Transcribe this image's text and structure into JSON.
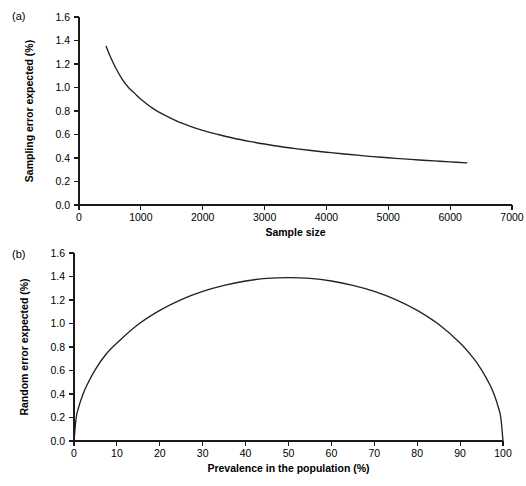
{
  "figure": {
    "panels": [
      {
        "tag": "(a)",
        "chart_data": {
          "type": "line",
          "title": "",
          "xlabel": "Sample size",
          "ylabel": "Sampling error expected (%)",
          "xlim": [
            0,
            7000
          ],
          "ylim": [
            0.0,
            1.6
          ],
          "xticks": [
            0,
            1000,
            2000,
            3000,
            4000,
            5000,
            6000,
            7000
          ],
          "xticklabels": [
            "0",
            "1000",
            "2000",
            "3000",
            "4000",
            "5000",
            "6000",
            "7000"
          ],
          "yticks": [
            0.0,
            0.2,
            0.4,
            0.6,
            0.8,
            1.0,
            1.2,
            1.4,
            1.6
          ],
          "yticklabels": [
            "0.0",
            "0.2",
            "0.4",
            "0.6",
            "0.8",
            "1.0",
            "1.2",
            "1.4",
            "1.6"
          ],
          "grid": false,
          "legend": null,
          "series": [
            {
              "name": "Sampling error vs sample size",
              "relation": "error = 28.4 / sqrt(n)",
              "x": [
                440,
                500,
                600,
                700,
                800,
                900,
                1000,
                1200,
                1400,
                1600,
                1800,
                2000,
                2250,
                2500,
                2750,
                3000,
                3250,
                3500,
                3750,
                4000,
                4250,
                4500,
                4750,
                5000,
                5250,
                5500,
                5750,
                6000,
                6270
              ],
              "y": [
                1.35,
                1.27,
                1.16,
                1.07,
                1.0,
                0.95,
                0.9,
                0.82,
                0.76,
                0.71,
                0.67,
                0.635,
                0.6,
                0.568,
                0.542,
                0.519,
                0.498,
                0.48,
                0.464,
                0.449,
                0.436,
                0.424,
                0.412,
                0.402,
                0.392,
                0.383,
                0.375,
                0.367,
                0.359
              ]
            }
          ]
        }
      },
      {
        "tag": "(b)",
        "chart_data": {
          "type": "line",
          "title": "",
          "xlabel": "Prevalence in the population (%)",
          "ylabel": "Random error expected (%)",
          "xlim": [
            0,
            100
          ],
          "ylim": [
            0.0,
            1.6
          ],
          "xticks": [
            0,
            10,
            20,
            30,
            40,
            50,
            60,
            70,
            80,
            90,
            100
          ],
          "xticklabels": [
            "0",
            "10",
            "20",
            "30",
            "40",
            "50",
            "60",
            "70",
            "80",
            "90",
            "100"
          ],
          "yticks": [
            0.0,
            0.2,
            0.4,
            0.6,
            0.8,
            1.0,
            1.2,
            1.4,
            1.6
          ],
          "yticklabels": [
            "0.0",
            "0.2",
            "0.4",
            "0.6",
            "0.8",
            "1.0",
            "1.2",
            "1.4",
            "1.6"
          ],
          "grid": false,
          "legend": null,
          "series": [
            {
              "name": "Random error vs prevalence",
              "relation": "error = 0.278 * sqrt(p*(100-p))",
              "x": [
                0,
                0.5,
                1,
                2,
                3,
                5,
                7.5,
                10,
                15,
                20,
                25,
                30,
                35,
                40,
                45,
                50,
                55,
                60,
                65,
                70,
                75,
                80,
                85,
                90,
                93,
                95,
                97,
                98,
                99,
                99.5,
                100
              ],
              "y": [
                0.0,
                0.196,
                0.277,
                0.39,
                0.475,
                0.61,
                0.74,
                0.834,
                0.993,
                1.112,
                1.204,
                1.274,
                1.325,
                1.362,
                1.384,
                1.39,
                1.384,
                1.362,
                1.325,
                1.274,
                1.204,
                1.112,
                0.993,
                0.834,
                0.709,
                0.606,
                0.475,
                0.39,
                0.277,
                0.196,
                0.0
              ]
            }
          ]
        }
      }
    ]
  },
  "colors": {
    "curve": "#222222",
    "axis": "#1a1a1a",
    "background": "#ffffff",
    "text": "#000000"
  }
}
